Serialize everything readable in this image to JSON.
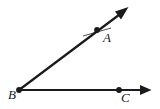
{
  "diagram": {
    "kind": "geometry-angle-diagram",
    "background_color": "#ffffff",
    "stroke_color": "#1a1a1a",
    "label_color": "#1a1a1a",
    "canvas": {
      "width": 160,
      "height": 109
    },
    "points": [
      {
        "id": "A",
        "label": "A",
        "x": 97,
        "y": 30,
        "label_x": 103,
        "label_y": 42,
        "dot": true,
        "dot_radius": 2.6
      },
      {
        "id": "B",
        "label": "B",
        "x": 19,
        "y": 90,
        "label_x": 8,
        "label_y": 99,
        "dot": true,
        "dot_radius": 2.6
      },
      {
        "id": "C",
        "label": "C",
        "x": 119,
        "y": 90,
        "label_x": 121,
        "label_y": 102,
        "dot": true,
        "dot_radius": 2.6
      }
    ],
    "rays": [
      {
        "id": "ray-BA",
        "label": "ray BA",
        "from": "B",
        "through": "A",
        "x1": 19,
        "y1": 90,
        "x2": 128,
        "y2": 8,
        "arrow_at_end": true,
        "stroke_width": 2.2
      },
      {
        "id": "ray-BC",
        "label": "ray BC",
        "from": "B",
        "through": "C",
        "x1": 19,
        "y1": 90,
        "x2": 151,
        "y2": 90,
        "arrow_at_end": true,
        "stroke_width": 2.2
      }
    ],
    "tick_marks": [
      {
        "id": "tick-at-A",
        "label": "hash mark on ray BA near A",
        "x1": 83,
        "y1": 36,
        "x2": 111,
        "y2": 28,
        "stroke_width": 0.9
      }
    ]
  }
}
